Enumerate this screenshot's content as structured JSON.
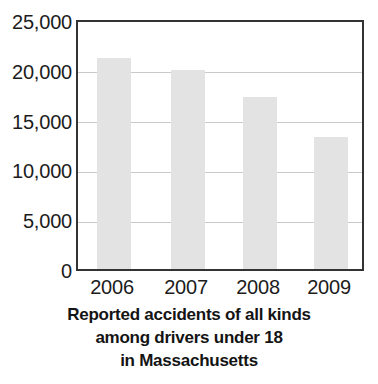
{
  "chart_data": {
    "type": "bar",
    "title": "",
    "categories": [
      "2006",
      "2007",
      "2008",
      "2009"
    ],
    "values": [
      21400,
      20100,
      17400,
      13400
    ],
    "xlabel": "",
    "ylabel": "",
    "ylim": [
      0,
      25000
    ],
    "yticks": [
      0,
      5000,
      10000,
      15000,
      20000,
      25000
    ],
    "ytick_labels": [
      "0",
      "5,000",
      "10,000",
      "15,000",
      "20,000",
      "25,000"
    ],
    "grid": true,
    "legend": false,
    "bar_color": "#e3e3e3",
    "axis_color": "#333333",
    "gridline_color": "#c9c9c9"
  },
  "caption": {
    "line1": "Reported accidents of all kinds",
    "line2": "among drivers under 18",
    "line3": "in Massachusetts"
  }
}
